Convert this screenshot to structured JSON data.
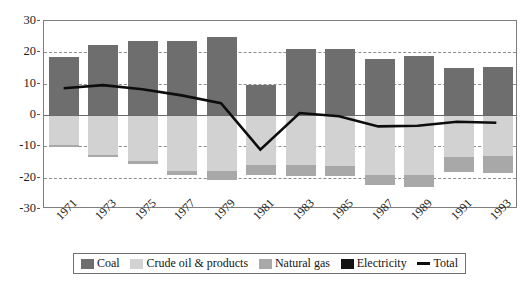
{
  "chart_data": {
    "type": "bar",
    "title": "",
    "subtitle": "",
    "xlabel": "",
    "ylabel": "",
    "stacked": true,
    "grid": true,
    "grid_lines_dashed": [
      20,
      10,
      -10,
      -20
    ],
    "legend_position": "bottom",
    "ylim": [
      -30,
      30
    ],
    "yticks": [
      30,
      20,
      10,
      0,
      -10,
      -20,
      -30
    ],
    "ytick_labels": [
      "30",
      "20",
      "10",
      "0",
      "-10",
      "-20",
      "-30"
    ],
    "categories": [
      "1971",
      "1973",
      "1975",
      "1977",
      "1979",
      "1981",
      "1983",
      "1985",
      "1987",
      "1989",
      "1991",
      "1993"
    ],
    "series": [
      {
        "name": "Coal",
        "color": "#6e6e6e",
        "values": [
          18.6,
          22.5,
          23.6,
          23.6,
          24.8,
          9.5,
          21.1,
          21.1,
          17.8,
          18.8,
          14.9,
          15.3
        ]
      },
      {
        "name": "Crude oil & products",
        "color": "#d2d2d2",
        "values": [
          -9.6,
          -12.8,
          -14.8,
          -17.9,
          -18.0,
          -16.0,
          -16.0,
          -16.3,
          -19.0,
          -19.1,
          -13.4,
          -13.2
        ]
      },
      {
        "name": "Natural gas",
        "color": "#a8a8a8",
        "values": [
          -0.7,
          -0.7,
          -0.9,
          -1.1,
          -2.9,
          -3.2,
          -3.4,
          -3.2,
          -3.4,
          -3.8,
          -4.8,
          -5.3
        ]
      },
      {
        "name": "Electricity",
        "color": "#141414",
        "values": [
          0,
          0,
          0,
          0,
          0,
          0,
          0,
          0,
          0,
          0,
          0,
          0
        ]
      }
    ],
    "line_series": {
      "name": "Total",
      "color": "#0d0d0d",
      "values": [
        8.3,
        9.3,
        8.0,
        6.0,
        3.5,
        -11.5,
        0.3,
        -0.7,
        -4.0,
        -3.8,
        -2.5,
        -2.8
      ]
    }
  },
  "legend": {
    "items": [
      {
        "label": "Coal",
        "swatch": "coal-swatch",
        "color": "#6e6e6e"
      },
      {
        "label": "Crude oil & products",
        "swatch": "crude-oil-swatch",
        "color": "#d2d2d2"
      },
      {
        "label": "Natural gas",
        "swatch": "natural-gas-swatch",
        "color": "#a8a8a8"
      },
      {
        "label": "Electricity",
        "swatch": "electricity-swatch",
        "color": "#141414"
      },
      {
        "label": "Total",
        "swatch": "total-line-swatch",
        "color": "#0d0d0d"
      }
    ]
  }
}
